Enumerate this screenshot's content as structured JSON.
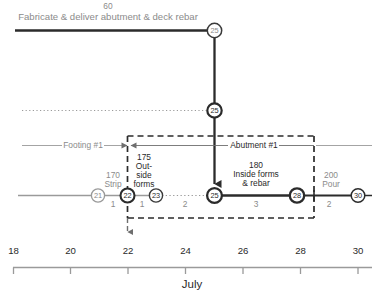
{
  "figure": {
    "type": "time-scaled CPM network / linear schedule diagram",
    "timeline_label": "July",
    "axis": {
      "ticks": [
        18,
        20,
        22,
        24,
        26,
        28,
        30
      ],
      "tick_labels": [
        "18",
        "20",
        "22",
        "24",
        "26",
        "28",
        "30"
      ],
      "min": 18,
      "max": 30.6,
      "unit": "day of month"
    },
    "bands": [
      {
        "name": "Footing #1",
        "label": "Footing #1"
      },
      {
        "name": "Abutment #1",
        "label": "Abutment #1"
      }
    ],
    "top_activity": {
      "id": "60",
      "description": "Fabricate & deliver abutment & deck rebar",
      "end_node": "25"
    },
    "nodes": [
      {
        "id": "21",
        "day": 21,
        "row": "bottom",
        "style": "light"
      },
      {
        "id": "22",
        "day": 22,
        "row": "bottom",
        "style": "bold"
      },
      {
        "id": "23",
        "day": 23,
        "row": "bottom",
        "style": "light"
      },
      {
        "id": "25",
        "day": 25,
        "row": "bottom",
        "style": "bold"
      },
      {
        "id": "28",
        "day": 28,
        "row": "bottom",
        "style": "bold"
      },
      {
        "id": "30",
        "day": 30,
        "row": "bottom",
        "style": "light"
      },
      {
        "id": "25",
        "day": 25,
        "row": "middle",
        "style": "bold"
      },
      {
        "id": "25",
        "day": 25,
        "row": "top",
        "style": "light"
      }
    ],
    "activities": [
      {
        "id": "170",
        "description": "Strip",
        "duration": "1",
        "from": "21",
        "to": "22",
        "critical": false
      },
      {
        "id": "175",
        "description": "Out-\nside\nforms",
        "duration": "1",
        "from": "22",
        "to": "23",
        "critical": false
      },
      {
        "id": "180",
        "description": "Inside forms\n& rebar",
        "duration": "3",
        "from": "25",
        "to": "28",
        "critical": true
      },
      {
        "id": "200",
        "description": "Pour",
        "duration": "2",
        "from": "28",
        "to": "30",
        "critical": false
      }
    ],
    "float_labels": [
      {
        "value": "2",
        "between": "23-25"
      },
      {
        "value": "2",
        "between": "28-30"
      }
    ],
    "activity_text": {
      "a170_id": "170",
      "a170_desc": "Strip",
      "a170_dur": "1",
      "a175_id": "175",
      "a175_desc_l1": "Out-",
      "a175_desc_l2": "side",
      "a175_desc_l3": "forms",
      "a175_dur": "1",
      "float_23_25": "2",
      "a180_id": "180",
      "a180_desc_l1": "Inside forms",
      "a180_desc_l2": "& rebar",
      "a180_dur": "3",
      "a200_id": "200",
      "a200_desc": "Pour",
      "a200_dur": "2"
    },
    "colors": {
      "critical": "#2b2b2b",
      "noncritical": "#9a9a9a",
      "text_gray": "#8b8b8b",
      "text_dark": "#2a2a2a",
      "background": "#ffffff"
    }
  }
}
